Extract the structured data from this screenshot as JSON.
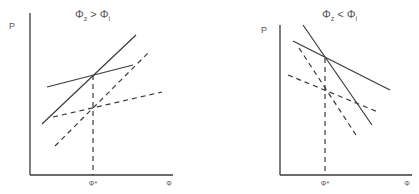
{
  "panels": [
    {
      "title": {
        "phi": "Φ",
        "sub1": "z",
        "op": ">",
        "sub2": "i"
      },
      "y_label": "P",
      "x_tick_label": "Φ*",
      "x_label": "Φ",
      "axes": {
        "x0": 30,
        "y0": 175,
        "xEnd": 173,
        "yTop": 13
      },
      "solid_lines": [
        {
          "x1": 42,
          "y1": 124,
          "x2": 136,
          "y2": 35
        },
        {
          "x1": 47,
          "y1": 87,
          "x2": 133,
          "y2": 65
        }
      ],
      "dashed_lines": [
        {
          "x1": 55,
          "y1": 146,
          "x2": 148,
          "y2": 53
        },
        {
          "x1": 53,
          "y1": 117,
          "x2": 162,
          "y2": 92
        }
      ],
      "drop_line": {
        "x": 93,
        "yTop": 75
      },
      "title_pos": {
        "x": 75,
        "y": 18
      },
      "p_pos": {
        "x": 9,
        "y": 29
      },
      "tick_pos": {
        "x": 93,
        "y": 186
      },
      "xlabel_pos": {
        "x": 169,
        "y": 186
      }
    },
    {
      "title": {
        "phi": "Φ",
        "sub1": "z",
        "op": "<",
        "sub2": "i"
      },
      "y_label": "P",
      "x_tick_label": "Φ*",
      "x_label": "Φ",
      "axes": {
        "x0": 280,
        "y0": 175,
        "xEnd": 412,
        "yTop": 25
      },
      "solid_lines": [
        {
          "x1": 303,
          "y1": 25,
          "x2": 372,
          "y2": 125
        },
        {
          "x1": 293,
          "y1": 41,
          "x2": 390,
          "y2": 90
        }
      ],
      "dashed_lines": [
        {
          "x1": 299,
          "y1": 48,
          "x2": 356,
          "y2": 135
        },
        {
          "x1": 288,
          "y1": 75,
          "x2": 378,
          "y2": 112
        }
      ],
      "drop_line": {
        "x": 325,
        "yTop": 58
      },
      "title_pos": {
        "x": 322,
        "y": 18
      },
      "p_pos": {
        "x": 261,
        "y": 33
      },
      "tick_pos": {
        "x": 325,
        "y": 186
      },
      "xlabel_pos": {
        "x": 407,
        "y": 186
      }
    }
  ],
  "colors": {
    "ink": "#3a3a3a",
    "label": "#555555"
  }
}
